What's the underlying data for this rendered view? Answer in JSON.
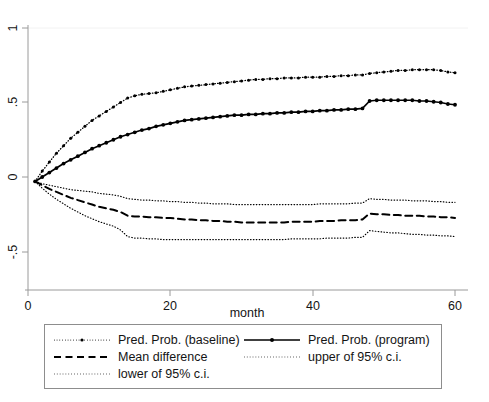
{
  "chart_data": {
    "type": "line",
    "title": "",
    "xlabel": "month",
    "ylabel": "",
    "xlim": [
      0,
      60
    ],
    "ylim": [
      -0.75,
      1.05
    ],
    "xticks": [
      0,
      20,
      40,
      60
    ],
    "xtick_labels": [
      "0",
      "20",
      "40",
      "60"
    ],
    "yticks": [
      -0.5,
      0,
      0.5,
      1
    ],
    "ytick_labels": [
      "-.5",
      "0",
      ".5",
      "1"
    ],
    "grid": "horizontal-faint",
    "legend_position": "below-plot",
    "x": [
      1,
      2,
      3,
      4,
      5,
      6,
      7,
      8,
      9,
      10,
      11,
      12,
      13,
      14,
      15,
      16,
      17,
      18,
      19,
      20,
      21,
      22,
      23,
      24,
      25,
      26,
      27,
      28,
      29,
      30,
      31,
      32,
      33,
      34,
      35,
      36,
      37,
      38,
      39,
      40,
      41,
      42,
      43,
      44,
      45,
      46,
      47,
      48,
      49,
      50,
      51,
      52,
      53,
      54,
      55,
      56,
      57,
      58,
      59,
      60
    ],
    "series": [
      {
        "name": "Pred. Prob. (baseline)",
        "style": "dotted-with-markers",
        "values": [
          -0.03,
          0.04,
          0.1,
          0.16,
          0.21,
          0.26,
          0.3,
          0.34,
          0.38,
          0.41,
          0.44,
          0.47,
          0.5,
          0.53,
          0.545,
          0.555,
          0.56,
          0.565,
          0.575,
          0.585,
          0.595,
          0.605,
          0.61,
          0.615,
          0.62,
          0.625,
          0.63,
          0.635,
          0.64,
          0.645,
          0.65,
          0.655,
          0.655,
          0.66,
          0.66,
          0.665,
          0.665,
          0.665,
          0.67,
          0.67,
          0.67,
          0.675,
          0.675,
          0.68,
          0.68,
          0.685,
          0.685,
          0.695,
          0.7,
          0.705,
          0.71,
          0.715,
          0.715,
          0.72,
          0.72,
          0.72,
          0.72,
          0.715,
          0.705,
          0.7
        ]
      },
      {
        "name": "Pred. Prob. (program)",
        "style": "solid-with-markers",
        "values": [
          -0.03,
          0.0,
          0.03,
          0.06,
          0.09,
          0.115,
          0.14,
          0.165,
          0.19,
          0.21,
          0.23,
          0.25,
          0.27,
          0.285,
          0.3,
          0.315,
          0.325,
          0.34,
          0.35,
          0.36,
          0.37,
          0.38,
          0.385,
          0.39,
          0.395,
          0.4,
          0.405,
          0.41,
          0.415,
          0.415,
          0.42,
          0.42,
          0.425,
          0.425,
          0.43,
          0.43,
          0.435,
          0.435,
          0.44,
          0.44,
          0.445,
          0.445,
          0.45,
          0.45,
          0.455,
          0.455,
          0.46,
          0.51,
          0.515,
          0.515,
          0.515,
          0.515,
          0.515,
          0.515,
          0.51,
          0.51,
          0.505,
          0.5,
          0.49,
          0.485
        ]
      },
      {
        "name": "Mean difference",
        "style": "dashed",
        "values": [
          -0.03,
          -0.055,
          -0.08,
          -0.1,
          -0.12,
          -0.14,
          -0.155,
          -0.17,
          -0.185,
          -0.2,
          -0.21,
          -0.22,
          -0.235,
          -0.26,
          -0.265,
          -0.265,
          -0.27,
          -0.27,
          -0.275,
          -0.275,
          -0.28,
          -0.285,
          -0.285,
          -0.29,
          -0.29,
          -0.295,
          -0.295,
          -0.3,
          -0.3,
          -0.305,
          -0.305,
          -0.305,
          -0.305,
          -0.305,
          -0.305,
          -0.305,
          -0.3,
          -0.3,
          -0.3,
          -0.3,
          -0.295,
          -0.295,
          -0.295,
          -0.29,
          -0.29,
          -0.29,
          -0.285,
          -0.245,
          -0.25,
          -0.25,
          -0.255,
          -0.255,
          -0.26,
          -0.26,
          -0.26,
          -0.265,
          -0.265,
          -0.27,
          -0.27,
          -0.275
        ]
      },
      {
        "name": "upper of 95% c.i.",
        "style": "dotted",
        "values": [
          -0.03,
          -0.045,
          -0.055,
          -0.065,
          -0.075,
          -0.085,
          -0.09,
          -0.095,
          -0.1,
          -0.11,
          -0.115,
          -0.12,
          -0.13,
          -0.145,
          -0.15,
          -0.155,
          -0.155,
          -0.16,
          -0.16,
          -0.165,
          -0.165,
          -0.17,
          -0.17,
          -0.175,
          -0.175,
          -0.18,
          -0.18,
          -0.18,
          -0.185,
          -0.185,
          -0.185,
          -0.185,
          -0.185,
          -0.185,
          -0.185,
          -0.185,
          -0.185,
          -0.185,
          -0.185,
          -0.185,
          -0.18,
          -0.18,
          -0.18,
          -0.18,
          -0.18,
          -0.175,
          -0.175,
          -0.145,
          -0.15,
          -0.15,
          -0.155,
          -0.155,
          -0.155,
          -0.16,
          -0.16,
          -0.16,
          -0.165,
          -0.165,
          -0.17,
          -0.17
        ]
      },
      {
        "name": "lower of 95% c.i.",
        "style": "dotted",
        "values": [
          -0.03,
          -0.075,
          -0.115,
          -0.15,
          -0.18,
          -0.21,
          -0.235,
          -0.26,
          -0.28,
          -0.3,
          -0.315,
          -0.33,
          -0.355,
          -0.4,
          -0.41,
          -0.41,
          -0.415,
          -0.415,
          -0.42,
          -0.42,
          -0.42,
          -0.42,
          -0.42,
          -0.42,
          -0.42,
          -0.42,
          -0.42,
          -0.42,
          -0.42,
          -0.42,
          -0.42,
          -0.42,
          -0.42,
          -0.42,
          -0.42,
          -0.42,
          -0.415,
          -0.415,
          -0.415,
          -0.415,
          -0.415,
          -0.41,
          -0.41,
          -0.41,
          -0.41,
          -0.405,
          -0.405,
          -0.36,
          -0.365,
          -0.37,
          -0.375,
          -0.375,
          -0.38,
          -0.385,
          -0.385,
          -0.39,
          -0.39,
          -0.395,
          -0.395,
          -0.4
        ]
      }
    ]
  },
  "axes": {
    "x_title": "month",
    "x_tick_labels": [
      "0",
      "20",
      "40",
      "60"
    ],
    "y_tick_labels": [
      "1",
      ".5",
      "0",
      "-.5"
    ]
  },
  "legend": {
    "entries": [
      {
        "label": "Pred. Prob. (baseline)",
        "key": "dotted-marker"
      },
      {
        "label": "Pred. Prob. (program)",
        "key": "solid-marker"
      },
      {
        "label": "Mean difference",
        "key": "dashed"
      },
      {
        "label": "upper of 95% c.i.",
        "key": "dotted"
      },
      {
        "label": "lower of 95% c.i.",
        "key": "dotted"
      }
    ]
  },
  "colors": {
    "ink": "#000000",
    "axis": "#9a9a9a",
    "grid": "#f2f2f2",
    "legend_border": "#8d8d8d",
    "background": "#ffffff"
  }
}
